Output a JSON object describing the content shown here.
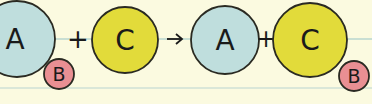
{
  "diagram": {
    "colors": {
      "background": "#fbfae0",
      "molecule_a": "#bfdedd",
      "molecule_b": "#e98f93",
      "molecule_c": "#e2db3a",
      "stroke": "#2a2a22",
      "guideline": "#b9d6cf"
    },
    "left_side": {
      "a_label": "A",
      "b_label": "B",
      "plus": "+",
      "c_label": "C"
    },
    "arrow": "→",
    "right_side": {
      "a_label": "A",
      "plus": "+",
      "c_label": "C",
      "b_label": "B"
    }
  }
}
